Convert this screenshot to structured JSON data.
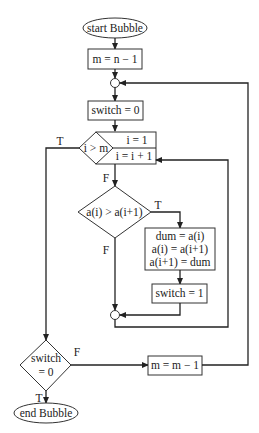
{
  "diagram": {
    "nodes": {
      "start": "start Bubble",
      "init_m": "m = n − 1",
      "reset_switch": "switch = 0",
      "loop_cond": "i > m",
      "loop_init": "i = 1",
      "loop_incr": "i = i + 1",
      "compare": "a(i) > a(i+1)",
      "swap_line1": "dum = a(i)",
      "swap_line2": "a(i) = a(i+1)",
      "swap_line3": "a(i+1) = dum",
      "set_switch": "switch = 1",
      "switch_cond_line1": "switch",
      "switch_cond_line2": "= 0",
      "decrement_m": "m = m − 1",
      "end": "end Bubble"
    },
    "edge_labels": {
      "loop_true": "T",
      "loop_false": "F",
      "compare_true": "T",
      "compare_false": "F",
      "switch_false": "F",
      "switch_true": "T"
    },
    "colors": {
      "stroke": "#222222",
      "background": "#ffffff"
    }
  }
}
